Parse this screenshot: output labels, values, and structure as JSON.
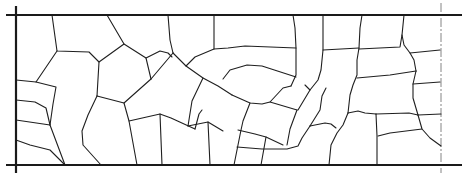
{
  "diagram": {
    "type": "cell-boundary-network",
    "colors": {
      "background": "#ffffff",
      "lines": "#1f1f1f",
      "walls": "#1a1a1a",
      "symmetry_line": "#777777"
    },
    "walls": {
      "top": {
        "x1": 6,
        "y1": 15,
        "x2": 462,
        "y2": 15
      },
      "bottom": {
        "x1": 6,
        "y1": 165,
        "x2": 462,
        "y2": 165
      },
      "left": {
        "x1": 16,
        "y1": 6,
        "x2": 16,
        "y2": 173
      }
    },
    "symmetry_line": {
      "x1": 441,
      "y1": 3,
      "x2": 441,
      "y2": 173
    },
    "boundaries": [
      "M52,15 L57,51 L89,52 L99,62",
      "M57,51 L36,82 L16,81",
      "M107,15 L124,44 L146,58 L151,79",
      "M124,44 L99,62 L97,96",
      "M146,58 L160,53",
      "M168,15 L171,43 L175,62",
      "M175,62 L146,79",
      "M151,79 L157,93 L178,104",
      "M213,15 L214,41 L225,38 L250,38 L296,41",
      "M213,41 L186,55 L176,62",
      "M296,15 L297,41 L298,77",
      "M175,62 L188,74 L213,88",
      "M188,74 L178,104",
      "M223,82 L236,74 L247,72 L296,78",
      "M298,77 L291,93",
      "M213,88 L251,104 L268,105 L281,102 L291,93",
      "M251,104 L241,117 L243,134 L236,140",
      "M281,102 L300,113",
      "M323,15 L322,55 L323,64 L316,77 L310,86",
      "M322,55 L358,52",
      "M362,15 L360,35 L357,52 L354,74 L350,88",
      "M360,35 L404,34",
      "M404,34 L402,15",
      "M404,34 L408,47 L414,58",
      "M408,47 L440,42",
      "M414,58 L410,72 L410,83",
      "M410,83 L441,83",
      "M357,76 L410,72",
      "M410,83 L413,98 L420,104",
      "M420,104 L440,117",
      "M420,104 L380,113 L376,113",
      "M350,88 L345,113 L345,126",
      "M345,113 L376,113",
      "M376,113 L378,139 L378,165",
      "M378,139 L412,134 L420,128",
      "M310,86 L305,102 L305,110",
      "M305,110 L280,111",
      "M300,113 L295,141",
      "M305,111 L330,107",
      "M345,126 L305,128",
      "M295,141 L280,165",
      "M305,128 L300,141 L283,145",
      "M236,140 L228,165",
      "M236,140 L262,141 L283,145",
      "M16,140 L38,140 L47,157 L53,166",
      "M16,120 L50,124 L55,126 L57,138 L51,140",
      "M55,126 L50,154",
      "M36,82 L16,82",
      "M97,96 L86,127 L83,141 L101,165",
      "M97,96 L130,103 L150,101",
      "M129,102 L137,116 L145,165",
      "M137,116 L162,147",
      "M86,127 L83,137",
      "M150,101 L156,123 L195,127 L198,165",
      "M156,123 L163,147",
      "M178,104 L166,133 L166,165",
      "M166,133 L198,127",
      "M198,127 L210,123 L227,128 L233,140",
      "M210,123 L214,165",
      "M16,105 L44,104 L53,107 L56,115 L51,140"
    ]
  }
}
